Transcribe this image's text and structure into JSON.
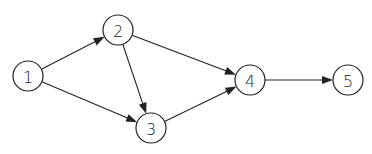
{
  "diagram": {
    "type": "directed-graph",
    "nodes": [
      {
        "id": "1",
        "label": "1"
      },
      {
        "id": "2",
        "label": "2"
      },
      {
        "id": "3",
        "label": "3"
      },
      {
        "id": "4",
        "label": "4"
      },
      {
        "id": "5",
        "label": "5"
      }
    ],
    "edges": [
      {
        "from": "1",
        "to": "2"
      },
      {
        "from": "1",
        "to": "3"
      },
      {
        "from": "2",
        "to": "3"
      },
      {
        "from": "2",
        "to": "4"
      },
      {
        "from": "3",
        "to": "4"
      },
      {
        "from": "4",
        "to": "5"
      }
    ],
    "colors": {
      "stroke": "#222222",
      "background": "#ffffff"
    }
  }
}
